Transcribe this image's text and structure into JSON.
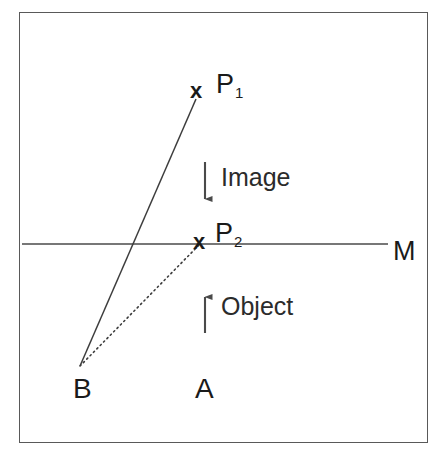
{
  "figure": {
    "background_color": "#ffffff",
    "line_color": "#4a4a4a",
    "text_color": "#1a1a1a",
    "border_color": "#595959",
    "width": 443,
    "height": 456
  },
  "labels": {
    "marker_p1": "x",
    "marker_p2": "x",
    "point_p1": "P",
    "point_p1_sub": "1",
    "point_p2": "P",
    "point_p2_sub": "2",
    "mirror_line": "M",
    "image_caption": "Image",
    "object_caption": "Object",
    "vertex_b": "B",
    "vertex_a": "A"
  },
  "geometry": {
    "mirror_line": {
      "x1": 22,
      "y1": 244,
      "x2": 388,
      "y2": 244
    },
    "solid_ray": {
      "x1": 80,
      "y1": 366,
      "x2": 196,
      "y2": 99,
      "style": "solid"
    },
    "dotted_ray": {
      "x1": 80,
      "y1": 366,
      "x2": 201,
      "y2": 243,
      "style": "dotted"
    },
    "image_arrow": {
      "x": 205,
      "y_top": 162,
      "y_bottom": 207,
      "direction": "down"
    },
    "object_arrow": {
      "x": 205,
      "y_top": 289,
      "y_bottom": 333,
      "direction": "up"
    },
    "point_p1": {
      "x": 198,
      "y": 91
    },
    "point_p2": {
      "x": 201,
      "y": 243
    },
    "point_b": {
      "x": 80,
      "y": 366
    },
    "border": {
      "x": 19,
      "y": 12,
      "width": 409,
      "height": 431
    }
  }
}
